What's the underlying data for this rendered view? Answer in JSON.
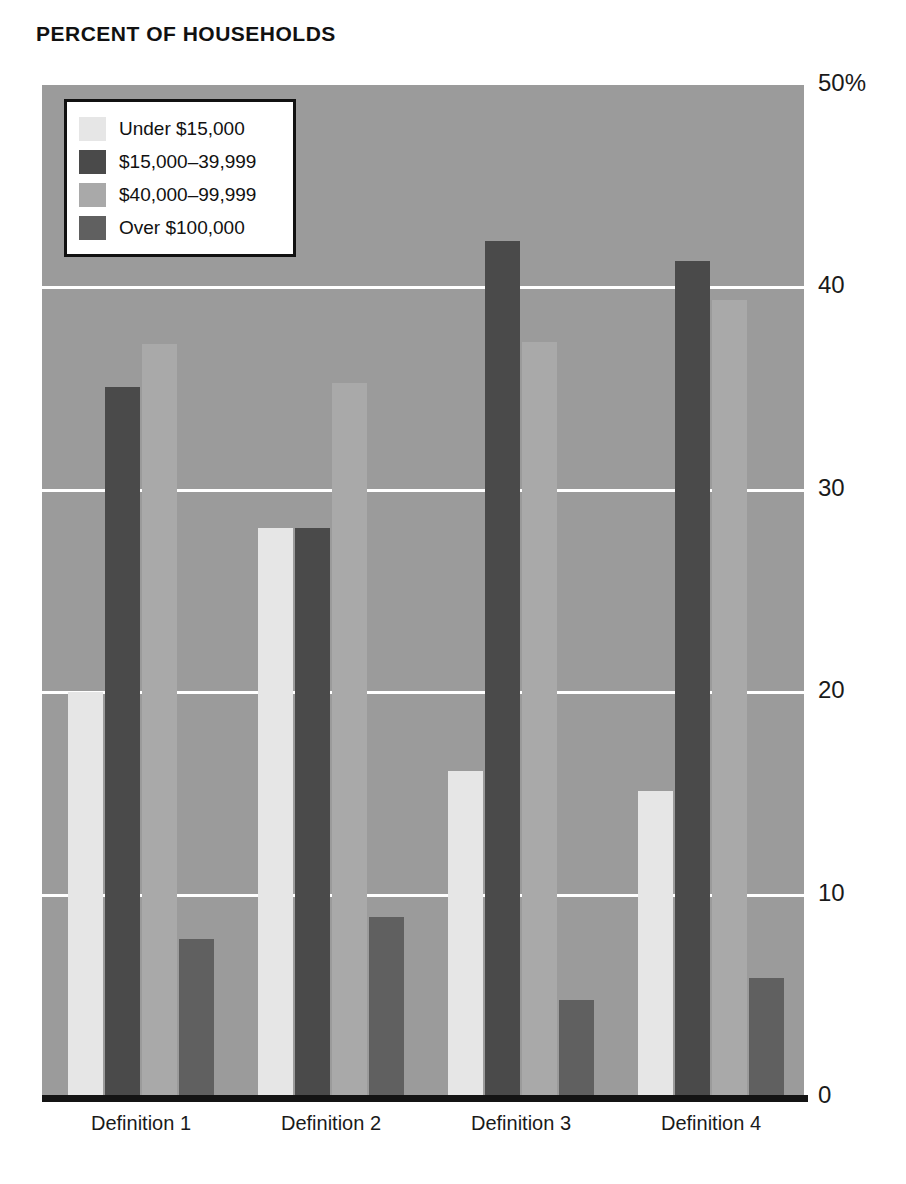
{
  "chart_data": {
    "type": "bar",
    "title": "PERCENT OF HOUSEHOLDS",
    "xlabel": "",
    "ylabel": "",
    "categories": [
      "Definition 1",
      "Definition 2",
      "Definition 3",
      "Definition 4"
    ],
    "series": [
      {
        "name": "Under $15,000",
        "color": "#e6e6e6",
        "values": [
          20.0,
          28.1,
          16.1,
          15.1
        ]
      },
      {
        "name": "$15,000–39,999",
        "color": "#4a4a4a",
        "values": [
          35.1,
          28.1,
          42.3,
          41.3
        ]
      },
      {
        "name": "$40,000–99,999",
        "color": "#a9a9a9",
        "values": [
          37.2,
          35.3,
          37.3,
          39.4
        ]
      },
      {
        "name": "Over $100,000",
        "color": "#606060",
        "values": [
          7.8,
          8.9,
          4.8,
          5.9
        ]
      }
    ],
    "ylim": [
      0,
      50
    ],
    "yticks": [
      0,
      10,
      20,
      30,
      40,
      50
    ],
    "ytick_labels": [
      "0",
      "10",
      "20",
      "30",
      "40",
      "50%"
    ],
    "grid": true,
    "gridlines_at": [
      10,
      20,
      30,
      40
    ],
    "legend_position": "top-left",
    "plot_background": "#9b9b9b",
    "gridline_color": "#ffffff",
    "axis_color": "#141414"
  },
  "legend": {
    "items": [
      {
        "label": "Under $15,000"
      },
      {
        "label": "$15,000–39,999"
      },
      {
        "label": "$40,000–99,999"
      },
      {
        "label": "Over $100,000"
      }
    ]
  },
  "axis": {
    "y_labels": [
      "50%",
      "40",
      "30",
      "20",
      "10",
      "0"
    ],
    "x_labels": [
      "Definition 1",
      "Definition 2",
      "Definition 3",
      "Definition 4"
    ]
  }
}
